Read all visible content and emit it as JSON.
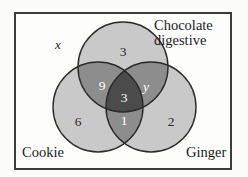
{
  "diagram": {
    "type": "venn-3-set",
    "title_visible": false,
    "universal_set_label": "x",
    "sets": [
      {
        "id": "chocolate-digestive",
        "label": "Chocolate\ndigestive",
        "position": "top"
      },
      {
        "id": "cookie",
        "label": "Cookie",
        "position": "bottom-left"
      },
      {
        "id": "ginger",
        "label": "Ginger",
        "position": "bottom-right"
      }
    ],
    "regions": [
      {
        "id": "chocolate-only",
        "value": "3",
        "shade": "light",
        "text_color": "#2a2a2a"
      },
      {
        "id": "cookie-only",
        "value": "6",
        "shade": "light",
        "text_color": "#2a2a2a"
      },
      {
        "id": "ginger-only",
        "value": "2",
        "shade": "light",
        "text_color": "#2a2a2a"
      },
      {
        "id": "cookie-chocolate",
        "value": "9",
        "shade": "mid",
        "text_color": "#ffffff"
      },
      {
        "id": "chocolate-ginger",
        "value": "y",
        "shade": "mid",
        "text_color": "#ffffff",
        "italic": true
      },
      {
        "id": "cookie-ginger",
        "value": "1",
        "shade": "mid",
        "text_color": "#ffffff"
      },
      {
        "id": "all-three",
        "value": "3",
        "shade": "dark",
        "text_color": "#ffffff"
      }
    ],
    "colors": {
      "circle_light": "#c9c9c9",
      "overlap_mid": "#8d8d8d",
      "overlap_dark": "#4b4b4b",
      "outline": "#2b2b2b",
      "frame_border": "#3b3b3b",
      "background": "#fdfdfc",
      "text_dark": "#1c1c1c",
      "text_light": "#ffffff"
    }
  }
}
